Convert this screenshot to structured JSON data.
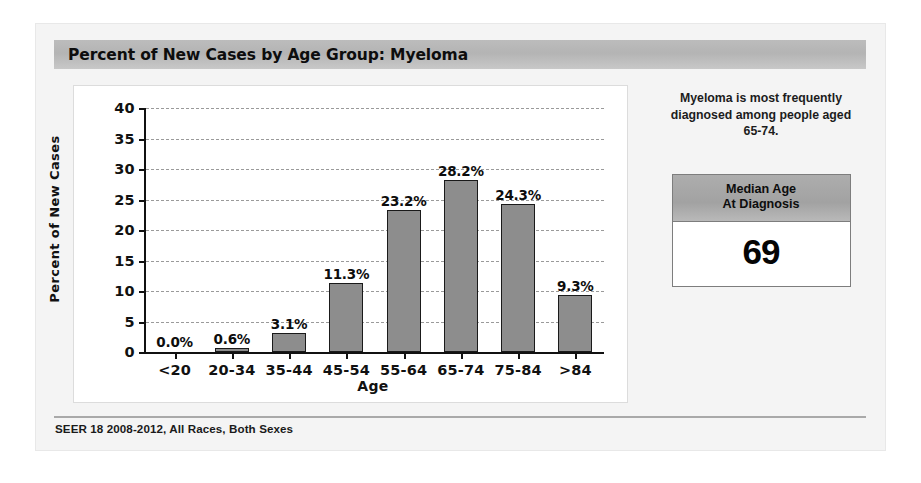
{
  "header": {
    "title": "Percent of New Cases by Age Group: Myeloma"
  },
  "side": {
    "note": "Myeloma is most frequently diagnosed among people aged 65-74.",
    "median_box": {
      "header_line1": "Median Age",
      "header_line2": "At Diagnosis",
      "value": "69"
    }
  },
  "footer": {
    "text": "SEER 18 2008-2012, All Races, Both Sexes"
  },
  "colors": {
    "bar_fill": "#8d8d8d",
    "bar_border": "#1a1a1a",
    "title_bar": "#b4b4b4",
    "gridline": "#9a9a9a",
    "panel_background": "#f4f4f4"
  },
  "chart_data": {
    "type": "bar",
    "title": "Percent of New Cases by Age Group: Myeloma",
    "xlabel": "Age",
    "ylabel": "Percent of New Cases",
    "ylim": [
      0,
      40
    ],
    "yticks": [
      0,
      5,
      10,
      15,
      20,
      25,
      30,
      35,
      40
    ],
    "grid": true,
    "legend": "none",
    "categories": [
      "<20",
      "20-34",
      "35-44",
      "45-54",
      "55-64",
      "65-74",
      "75-84",
      ">84"
    ],
    "values": [
      0.0,
      0.6,
      3.1,
      11.3,
      23.2,
      28.2,
      24.3,
      9.3
    ],
    "data_labels": [
      "0.0%",
      "0.6%",
      "3.1%",
      "11.3%",
      "23.2%",
      "28.2%",
      "24.3%",
      "9.3%"
    ],
    "source": "SEER 18 2008-2012, All Races, Both Sexes",
    "annotation": "Myeloma is most frequently diagnosed among people aged 65-74.",
    "median_age_at_diagnosis": 69
  }
}
